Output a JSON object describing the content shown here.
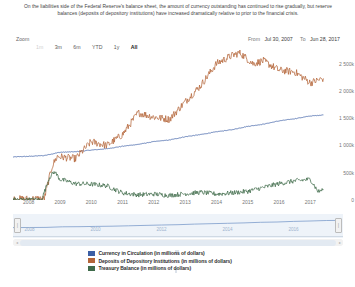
{
  "caption": "On the liabilities side of the Federal Reserve's balance sheet, the amount of currency outstanding has continued to rise gradually, but reserve balances (deposits of depository institutions) have increased dramatically relative to prior to the financial crisis.",
  "toolbar": {
    "zoom_label": "Zoom",
    "buttons": [
      {
        "label": "1m",
        "state": "disabled"
      },
      {
        "label": "3m",
        "state": "normal"
      },
      {
        "label": "6m",
        "state": "normal"
      },
      {
        "label": "YTD",
        "state": "normal"
      },
      {
        "label": "1y",
        "state": "normal"
      },
      {
        "label": "All",
        "state": "selected"
      }
    ],
    "from_label": "From",
    "from_value": "Jul 30, 2007",
    "to_label": "To",
    "to_value": "Jun 28, 2017"
  },
  "navigator": {
    "xticks": [
      "2008",
      "2010",
      "2012",
      "2014",
      "2016"
    ],
    "left_handle": "|",
    "right_handle": "|",
    "scroll_left": "◂",
    "scroll_right": "▸"
  },
  "legend": [
    {
      "label": "Currency in Circulation (in millions of dollars)",
      "color": "#3c5fa5"
    },
    {
      "label": "Deposits of Depository Institutions (in millions of dollars)",
      "color": "#b4653a"
    },
    {
      "label": "Treasury Balance (in millions of dollars)",
      "color": "#3f6b4a"
    }
  ],
  "chart_data": {
    "type": "line",
    "title": "",
    "xlabel": "",
    "ylabel": "",
    "grid": false,
    "legend_position": "bottom",
    "xlim": [
      "2007-07-30",
      "2017-06-28"
    ],
    "ylim": [
      0,
      2750000
    ],
    "yticks": [
      0,
      500000,
      1000000,
      1500000,
      2000000,
      2500000
    ],
    "ytick_labels": [
      "0",
      "500k",
      "1 000k",
      "1 500k",
      "2 000k",
      "2 500k"
    ],
    "xticks": [
      "2008",
      "2009",
      "2010",
      "2011",
      "2012",
      "2013",
      "2014",
      "2015",
      "2016",
      "2017"
    ],
    "series": [
      {
        "name": "Currency in Circulation (in millions of dollars)",
        "color": "#3c5fa5",
        "x": [
          "2007-07",
          "2008-01",
          "2008-07",
          "2009-01",
          "2009-07",
          "2010-01",
          "2010-07",
          "2011-01",
          "2011-07",
          "2012-01",
          "2012-07",
          "2013-01",
          "2013-07",
          "2014-01",
          "2014-07",
          "2015-01",
          "2015-07",
          "2016-01",
          "2016-07",
          "2017-01",
          "2017-06"
        ],
        "values": [
          790000,
          800000,
          815000,
          875000,
          885000,
          915000,
          940000,
          985000,
          1020000,
          1070000,
          1100000,
          1160000,
          1200000,
          1250000,
          1290000,
          1350000,
          1390000,
          1450000,
          1490000,
          1540000,
          1560000
        ]
      },
      {
        "name": "Deposits of Depository Institutions (in millions of dollars)",
        "color": "#b4653a",
        "x": [
          "2007-07",
          "2008-01",
          "2008-07",
          "2008-10",
          "2008-12",
          "2009-03",
          "2009-07",
          "2010-01",
          "2010-07",
          "2011-01",
          "2011-07",
          "2012-01",
          "2012-07",
          "2013-01",
          "2013-07",
          "2014-01",
          "2014-07",
          "2014-10",
          "2015-03",
          "2015-07",
          "2016-01",
          "2016-07",
          "2017-01",
          "2017-06"
        ],
        "values": [
          15000,
          20000,
          22000,
          620000,
          800000,
          780000,
          760000,
          1070000,
          1000000,
          1200000,
          1600000,
          1520000,
          1480000,
          1800000,
          2100000,
          2500000,
          2650000,
          2700000,
          2500000,
          2550000,
          2380000,
          2350000,
          2150000,
          2230000
        ]
      },
      {
        "name": "Treasury Balance (in millions of dollars)",
        "color": "#3f6b4a",
        "x": [
          "2007-07",
          "2008-06",
          "2008-09",
          "2008-11",
          "2009-01",
          "2009-07",
          "2010-01",
          "2010-07",
          "2011-01",
          "2011-07",
          "2012-01",
          "2012-07",
          "2013-01",
          "2013-07",
          "2014-01",
          "2014-07",
          "2015-01",
          "2015-07",
          "2016-01",
          "2016-07",
          "2017-01",
          "2017-04",
          "2017-06"
        ],
        "values": [
          5000,
          5000,
          420000,
          520000,
          380000,
          300000,
          290000,
          260000,
          130000,
          95000,
          110000,
          85000,
          115000,
          140000,
          110000,
          130000,
          160000,
          230000,
          300000,
          350000,
          380000,
          150000,
          195000
        ]
      }
    ]
  }
}
